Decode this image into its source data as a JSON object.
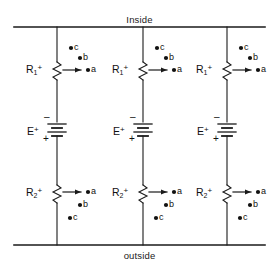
{
  "figure": {
    "type": "circuit-diagram",
    "background_color": "#ffffff",
    "line_color": "#1a1a1a"
  },
  "boundaries": {
    "top_label": "Inside",
    "bottom_label": "outside"
  },
  "branches": [
    {
      "id": "branch-1",
      "x": 57,
      "upper_resistor": {
        "label_base": "R",
        "subscript": "1",
        "superscript": "+"
      },
      "battery": {
        "label_base": "E",
        "superscript": "+",
        "top_sign": "–",
        "bottom_sign": "+"
      },
      "lower_resistor": {
        "label_base": "R",
        "subscript": "2",
        "superscript": "+"
      },
      "upper_nodes": [
        {
          "label": "c",
          "dot_x": 71,
          "dot_y": 48,
          "text_x": 74,
          "text_y": 42
        },
        {
          "label": "b",
          "dot_x": 80,
          "dot_y": 58,
          "text_x": 83,
          "text_y": 53
        },
        {
          "label": "a",
          "dot_x": 88,
          "dot_y": 70,
          "text_x": 91,
          "text_y": 65
        }
      ],
      "lower_nodes": [
        {
          "label": "a",
          "dot_x": 88,
          "dot_y": 192,
          "text_x": 91,
          "text_y": 187
        },
        {
          "label": "b",
          "dot_x": 80,
          "dot_y": 205,
          "text_x": 83,
          "text_y": 200
        },
        {
          "label": "c",
          "dot_x": 70,
          "dot_y": 218,
          "text_x": 73,
          "text_y": 213
        }
      ]
    },
    {
      "id": "branch-2",
      "x": 143,
      "upper_resistor": {
        "label_base": "R",
        "subscript": "1",
        "superscript": "+"
      },
      "battery": {
        "label_base": "E",
        "superscript": "+",
        "top_sign": "–",
        "bottom_sign": "+"
      },
      "lower_resistor": {
        "label_base": "R",
        "subscript": "2",
        "superscript": "+"
      },
      "upper_nodes": [
        {
          "label": "c",
          "dot_x": 157,
          "dot_y": 48,
          "text_x": 160,
          "text_y": 42
        },
        {
          "label": "b",
          "dot_x": 166,
          "dot_y": 58,
          "text_x": 169,
          "text_y": 53
        },
        {
          "label": "a",
          "dot_x": 174,
          "dot_y": 70,
          "text_x": 177,
          "text_y": 65
        }
      ],
      "lower_nodes": [
        {
          "label": "a",
          "dot_x": 174,
          "dot_y": 192,
          "text_x": 177,
          "text_y": 187
        },
        {
          "label": "b",
          "dot_x": 166,
          "dot_y": 205,
          "text_x": 169,
          "text_y": 200
        },
        {
          "label": "c",
          "dot_x": 156,
          "dot_y": 218,
          "text_x": 159,
          "text_y": 213
        }
      ]
    },
    {
      "id": "branch-3",
      "x": 227,
      "upper_resistor": {
        "label_base": "R",
        "subscript": "1",
        "superscript": "+"
      },
      "battery": {
        "label_base": "E",
        "superscript": "+",
        "top_sign": "–",
        "bottom_sign": "+"
      },
      "lower_resistor": {
        "label_base": "R",
        "subscript": "2",
        "superscript": "+"
      },
      "upper_nodes": [
        {
          "label": "c",
          "dot_x": 241,
          "dot_y": 48,
          "text_x": 244,
          "text_y": 42
        },
        {
          "label": "b",
          "dot_x": 250,
          "dot_y": 58,
          "text_x": 253,
          "text_y": 53
        },
        {
          "label": "a",
          "dot_x": 258,
          "dot_y": 70,
          "text_x": 261,
          "text_y": 65
        }
      ],
      "lower_nodes": [
        {
          "label": "a",
          "dot_x": 258,
          "dot_y": 192,
          "text_x": 261,
          "text_y": 187
        },
        {
          "label": "b",
          "dot_x": 250,
          "dot_y": 205,
          "text_x": 253,
          "text_y": 200
        },
        {
          "label": "c",
          "dot_x": 240,
          "dot_y": 218,
          "text_x": 243,
          "text_y": 213
        }
      ]
    }
  ]
}
